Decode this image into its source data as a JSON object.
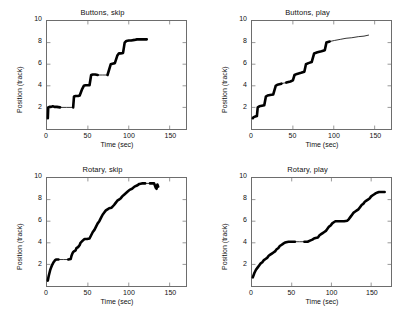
{
  "figure": {
    "background": "#ffffff",
    "axis_color": "#6d6d6d",
    "data_color": "#000000",
    "width": 410,
    "height": 314
  },
  "chart_data": [
    {
      "type": "line",
      "id": "buttons-skip",
      "title": "Buttons, skip",
      "xlabel": "Time (sec)",
      "ylabel": "Position (track)",
      "xlim": [
        0,
        170
      ],
      "ylim": [
        0,
        10
      ],
      "xticks": [
        0,
        50,
        100,
        150
      ],
      "yticks": [
        2,
        4,
        6,
        8,
        10
      ],
      "grid": false,
      "legend": null,
      "series": [
        {
          "name": "position",
          "points": [
            [
              1,
              1.0
            ],
            [
              1.5,
              2.0
            ],
            [
              3,
              2.05
            ],
            [
              5,
              2.05
            ],
            [
              7,
              2.1
            ],
            [
              9,
              2.05
            ],
            [
              12,
              2.05
            ],
            [
              16,
              2.0
            ],
            [
              24,
              2.0
            ],
            [
              32,
              2.0
            ],
            [
              33,
              3.0
            ],
            [
              35,
              3.05
            ],
            [
              38,
              3.05
            ],
            [
              40,
              3.1
            ],
            [
              43,
              3.7
            ],
            [
              45,
              4.0
            ],
            [
              47,
              4.05
            ],
            [
              50,
              4.05
            ],
            [
              52,
              4.05
            ],
            [
              54,
              5.0
            ],
            [
              56,
              5.05
            ],
            [
              59,
              5.05
            ],
            [
              62,
              5.0
            ],
            [
              68,
              5.0
            ],
            [
              74,
              5.0
            ],
            [
              78,
              6.0
            ],
            [
              80,
              6.05
            ],
            [
              83,
              6.1
            ],
            [
              86,
              6.8
            ],
            [
              88,
              7.0
            ],
            [
              90,
              7.0
            ],
            [
              93,
              7.05
            ],
            [
              95,
              8.0
            ],
            [
              97,
              8.15
            ],
            [
              100,
              8.2
            ],
            [
              103,
              8.2
            ],
            [
              107,
              8.25
            ],
            [
              110,
              8.3
            ],
            [
              114,
              8.3
            ],
            [
              118,
              8.3
            ],
            [
              122,
              8.3
            ]
          ]
        }
      ]
    },
    {
      "type": "line",
      "id": "buttons-play",
      "title": "Buttons, play",
      "xlabel": "Time (sec)",
      "ylabel": "Position (track)",
      "xlim": [
        0,
        170
      ],
      "ylim": [
        0,
        10
      ],
      "xticks": [
        0,
        50,
        100,
        150
      ],
      "yticks": [
        2,
        4,
        6,
        8,
        10
      ],
      "grid": false,
      "legend": null,
      "series": [
        {
          "name": "position",
          "points": [
            [
              1,
              1.0
            ],
            [
              2,
              1.1
            ],
            [
              4,
              1.15
            ],
            [
              6,
              1.2
            ],
            [
              7,
              2.0
            ],
            [
              9,
              2.1
            ],
            [
              12,
              2.15
            ],
            [
              15,
              2.2
            ],
            [
              17,
              3.0
            ],
            [
              19,
              3.1
            ],
            [
              22,
              3.15
            ],
            [
              26,
              3.2
            ],
            [
              29,
              4.0
            ],
            [
              31,
              4.1
            ],
            [
              36,
              4.2
            ],
            [
              42,
              4.3
            ],
            [
              47,
              4.4
            ],
            [
              50,
              4.5
            ],
            [
              52,
              5.0
            ],
            [
              55,
              5.1
            ],
            [
              60,
              5.2
            ],
            [
              64,
              5.3
            ],
            [
              66,
              6.0
            ],
            [
              69,
              6.1
            ],
            [
              73,
              6.2
            ],
            [
              76,
              7.0
            ],
            [
              80,
              7.1
            ],
            [
              85,
              7.2
            ],
            [
              89,
              7.3
            ],
            [
              91,
              8.0
            ],
            [
              95,
              8.1
            ],
            [
              101,
              8.2
            ],
            [
              108,
              8.3
            ],
            [
              115,
              8.4
            ],
            [
              122,
              8.45
            ],
            [
              130,
              8.55
            ],
            [
              137,
              8.6
            ],
            [
              143,
              8.7
            ]
          ]
        }
      ]
    },
    {
      "type": "line",
      "id": "rotary-skip",
      "title": "Rotary, skip",
      "xlabel": "Time (sec)",
      "ylabel": "Position (track)",
      "xlim": [
        0,
        170
      ],
      "ylim": [
        0,
        10
      ],
      "xticks": [
        0,
        50,
        100,
        150
      ],
      "yticks": [
        2,
        4,
        6,
        8,
        10
      ],
      "grid": false,
      "legend": null,
      "series": [
        {
          "name": "position",
          "points": [
            [
              1,
              0.5
            ],
            [
              2,
              0.9
            ],
            [
              3,
              1.2
            ],
            [
              4,
              1.5
            ],
            [
              5,
              1.7
            ],
            [
              6,
              1.9
            ],
            [
              7,
              2.05
            ],
            [
              8,
              2.2
            ],
            [
              9,
              2.3
            ],
            [
              10,
              2.4
            ],
            [
              11,
              2.45
            ],
            [
              14,
              2.45
            ],
            [
              20,
              2.45
            ],
            [
              26,
              2.45
            ],
            [
              29,
              2.5
            ],
            [
              30,
              2.8
            ],
            [
              31,
              3.0
            ],
            [
              32,
              3.15
            ],
            [
              33,
              3.2
            ],
            [
              35,
              3.3
            ],
            [
              36,
              3.5
            ],
            [
              38,
              3.6
            ],
            [
              40,
              3.8
            ],
            [
              41,
              4.0
            ],
            [
              43,
              4.15
            ],
            [
              45,
              4.3
            ],
            [
              46,
              4.35
            ],
            [
              49,
              4.35
            ],
            [
              52,
              4.4
            ],
            [
              54,
              4.7
            ],
            [
              56,
              5.0
            ],
            [
              58,
              5.2
            ],
            [
              60,
              5.5
            ],
            [
              62,
              5.8
            ],
            [
              64,
              6.0
            ],
            [
              66,
              6.3
            ],
            [
              68,
              6.6
            ],
            [
              70,
              6.8
            ],
            [
              72,
              7.0
            ],
            [
              74,
              7.1
            ],
            [
              76,
              7.2
            ],
            [
              79,
              7.25
            ],
            [
              82,
              7.5
            ],
            [
              84,
              7.7
            ],
            [
              86,
              7.9
            ],
            [
              88,
              8.0
            ],
            [
              90,
              8.1
            ],
            [
              92,
              8.3
            ],
            [
              95,
              8.5
            ],
            [
              98,
              8.7
            ],
            [
              101,
              8.9
            ],
            [
              104,
              9.0
            ],
            [
              107,
              9.2
            ],
            [
              110,
              9.3
            ],
            [
              113,
              9.45
            ],
            [
              116,
              9.5
            ],
            [
              120,
              9.5
            ],
            [
              126,
              9.5
            ],
            [
              131,
              9.5
            ],
            [
              132,
              9.3
            ],
            [
              133,
              9.1
            ],
            [
              134,
              9.0
            ],
            [
              135,
              9.4
            ],
            [
              136,
              9.2
            ]
          ]
        }
      ]
    },
    {
      "type": "line",
      "id": "rotary-play",
      "title": "Rotary, play",
      "xlabel": "Time (sec)",
      "ylabel": "Position (track)",
      "xlim": [
        0,
        175
      ],
      "ylim": [
        0,
        10
      ],
      "xticks": [
        0,
        50,
        100,
        150
      ],
      "yticks": [
        2,
        4,
        6,
        8,
        10
      ],
      "grid": false,
      "legend": null,
      "series": [
        {
          "name": "position",
          "points": [
            [
              1,
              0.8
            ],
            [
              3,
              1.2
            ],
            [
              5,
              1.5
            ],
            [
              7,
              1.7
            ],
            [
              9,
              1.9
            ],
            [
              11,
              2.1
            ],
            [
              13,
              2.2
            ],
            [
              15,
              2.4
            ],
            [
              17,
              2.5
            ],
            [
              19,
              2.6
            ],
            [
              21,
              2.8
            ],
            [
              23,
              2.9
            ],
            [
              25,
              3.0
            ],
            [
              27,
              3.1
            ],
            [
              29,
              3.2
            ],
            [
              31,
              3.4
            ],
            [
              33,
              3.5
            ],
            [
              35,
              3.7
            ],
            [
              37,
              3.8
            ],
            [
              39,
              3.9
            ],
            [
              41,
              4.0
            ],
            [
              43,
              4.05
            ],
            [
              46,
              4.1
            ],
            [
              50,
              4.1
            ],
            [
              54,
              4.1
            ],
            [
              60,
              4.1
            ],
            [
              66,
              4.1
            ],
            [
              70,
              4.1
            ],
            [
              73,
              4.2
            ],
            [
              76,
              4.3
            ],
            [
              78,
              4.4
            ],
            [
              80,
              4.45
            ],
            [
              83,
              4.5
            ],
            [
              85,
              4.7
            ],
            [
              87,
              4.8
            ],
            [
              89,
              4.9
            ],
            [
              91,
              5.0
            ],
            [
              93,
              5.1
            ],
            [
              95,
              5.3
            ],
            [
              97,
              5.5
            ],
            [
              99,
              5.6
            ],
            [
              101,
              5.8
            ],
            [
              103,
              5.9
            ],
            [
              105,
              6.0
            ],
            [
              108,
              6.0
            ],
            [
              112,
              6.0
            ],
            [
              116,
              6.0
            ],
            [
              120,
              6.05
            ],
            [
              122,
              6.2
            ],
            [
              124,
              6.4
            ],
            [
              126,
              6.6
            ],
            [
              128,
              6.8
            ],
            [
              130,
              6.9
            ],
            [
              132,
              7.0
            ],
            [
              134,
              7.1
            ],
            [
              136,
              7.3
            ],
            [
              138,
              7.5
            ],
            [
              140,
              7.6
            ],
            [
              142,
              7.8
            ],
            [
              144,
              7.9
            ],
            [
              146,
              8.0
            ],
            [
              148,
              8.1
            ],
            [
              150,
              8.3
            ],
            [
              152,
              8.4
            ],
            [
              154,
              8.5
            ],
            [
              156,
              8.6
            ],
            [
              158,
              8.65
            ],
            [
              160,
              8.7
            ],
            [
              163,
              8.7
            ],
            [
              167,
              8.7
            ]
          ]
        }
      ]
    }
  ]
}
